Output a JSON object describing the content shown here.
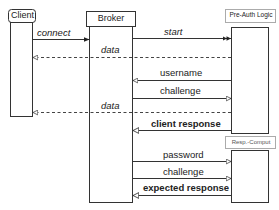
{
  "diagram": {
    "type": "sequence",
    "participants": {
      "client": {
        "label": "Client"
      },
      "broker": {
        "label": "Broker"
      },
      "preauth": {
        "label": "Pre-Auth Logic"
      },
      "respcomput": {
        "label": "Resp.-Comput"
      }
    },
    "messages": [
      {
        "label": "connect",
        "from": "Client",
        "to": "Broker",
        "style": "solid",
        "head": "filled"
      },
      {
        "label": "start",
        "from": "Broker",
        "to": "Pre-Auth Logic",
        "style": "solid",
        "head": "double-filled"
      },
      {
        "label": "data",
        "from": "Pre-Auth Logic",
        "to": "Client",
        "style": "dashed",
        "head": "open"
      },
      {
        "label": "username",
        "from": "Pre-Auth Logic",
        "to": "Broker",
        "style": "solid",
        "head": "open"
      },
      {
        "label": "challenge",
        "from": "Broker",
        "to": "Pre-Auth Logic",
        "style": "solid",
        "head": "open"
      },
      {
        "label": "data",
        "from": "Pre-Auth Logic",
        "to": "Client",
        "style": "dashed",
        "head": "open"
      },
      {
        "label": "client response",
        "from": "Pre-Auth Logic",
        "to": "Broker",
        "style": "solid-bold",
        "head": "open"
      },
      {
        "label": "password",
        "from": "Broker",
        "to": "Resp.-Comput",
        "style": "solid",
        "head": "open"
      },
      {
        "label": "challenge",
        "from": "Broker",
        "to": "Resp.-Comput",
        "style": "solid",
        "head": "open"
      },
      {
        "label": "expected response",
        "from": "Resp.-Comput",
        "to": "Broker",
        "style": "solid-bold",
        "head": "open"
      }
    ],
    "colors": {
      "line": "#333333",
      "text": "#222222",
      "background": "#ffffff"
    }
  }
}
